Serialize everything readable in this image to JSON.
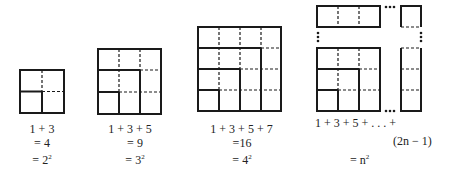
{
  "figure": {
    "colors": {
      "line": "#1a1a1a",
      "background": "#ffffff"
    },
    "panels": [
      {
        "id": "n2",
        "sum": "1 + 3",
        "value": "= 4",
        "square_base": "= 2",
        "square_exp": "2"
      },
      {
        "id": "n3",
        "sum": "1 + 3 + 5",
        "value": "= 9",
        "square_base": "= 3",
        "square_exp": "2"
      },
      {
        "id": "n4",
        "sum": "1 + 3 + 5 + 7",
        "value": "=16",
        "square_base": "= 4",
        "square_exp": "2"
      },
      {
        "id": "nn",
        "sum": "1 + 3 + 5 + . . . +",
        "last_term": "(2n − 1)",
        "square_base": "= n",
        "square_exp": "2"
      }
    ],
    "ellipsis": "…"
  }
}
